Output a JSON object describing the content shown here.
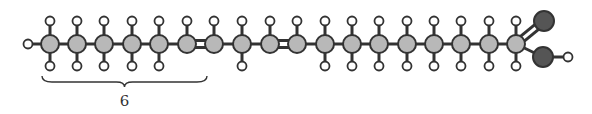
{
  "diagram": {
    "colors": {
      "carbon": "#b8b8b8",
      "oxygen": "#555555",
      "hydrogen": "#ffffff",
      "stroke": "#333333"
    },
    "carbons": [
      {
        "x": 50,
        "top_h": true,
        "bottom_h": true
      },
      {
        "x": 77,
        "top_h": true,
        "bottom_h": true
      },
      {
        "x": 104,
        "top_h": true,
        "bottom_h": true
      },
      {
        "x": 132,
        "top_h": true,
        "bottom_h": true
      },
      {
        "x": 159,
        "top_h": true,
        "bottom_h": true
      },
      {
        "x": 187,
        "top_h": true,
        "bottom_h": false
      },
      {
        "x": 214,
        "top_h": true,
        "bottom_h": false
      },
      {
        "x": 242,
        "top_h": true,
        "bottom_h": true
      },
      {
        "x": 270,
        "top_h": true,
        "bottom_h": false
      },
      {
        "x": 297,
        "top_h": true,
        "bottom_h": false
      },
      {
        "x": 325,
        "top_h": true,
        "bottom_h": true
      },
      {
        "x": 352,
        "top_h": true,
        "bottom_h": true
      },
      {
        "x": 379,
        "top_h": true,
        "bottom_h": true
      },
      {
        "x": 407,
        "top_h": true,
        "bottom_h": true
      },
      {
        "x": 434,
        "top_h": true,
        "bottom_h": true
      },
      {
        "x": 461,
        "top_h": true,
        "bottom_h": true
      },
      {
        "x": 489,
        "top_h": true,
        "bottom_h": true
      },
      {
        "x": 516,
        "top_h": true,
        "bottom_h": true
      }
    ],
    "double_bonds": [
      [
        5,
        6
      ],
      [
        8,
        9
      ]
    ],
    "terminal_h": {
      "x": 28,
      "y": 44
    },
    "carboxyl": {
      "carbonyl_o": {
        "x": 544,
        "y": 21
      },
      "hydroxyl_o": {
        "x": 543,
        "y": 57
      },
      "hydroxyl_h": {
        "x": 568,
        "y": 57
      }
    },
    "brace": {
      "x_start": 42,
      "x_end": 207,
      "y": 76,
      "label": "6"
    }
  }
}
